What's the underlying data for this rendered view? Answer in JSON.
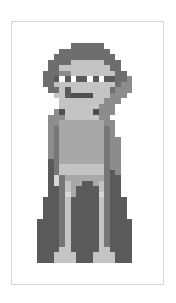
{
  "image": {
    "description": "Grayscale pixel-art figure of a person with dark hair, light visor with four white dot eyes, one arm raised to head, standing in a long dark robe, inside a thin light-gray frame",
    "caption": "Pixel art figure"
  },
  "palette": {
    ".": "transparent",
    "H": "#6e6e6e",
    "D": "#5a5a5a",
    "M": "#8c8c8c",
    "L": "#c4c4c4",
    "l": "#d8d8d8",
    "W": "#ffffff",
    "S": "#a8a8a8",
    "R": "#767676",
    "K": "#4e4e4e"
  },
  "pixel_rows": [
    "......HHHHHH......",
    "....HHHHHHHHH.....",
    "...HHHHHHHHHHH....",
    "..HHHHLLLLLLHHH...",
    "..HHLLLLLLLLLHH...",
    ".HHHMMLLLLLLLLHH..",
    ".HHDWDWDDWDWDDHHM.",
    ".HHLLLLLLLLLLLHMM.",
    "..HHLDLLLLLLLHMMM.",
    "...LLDKKKKLLLMMM..",
    "....LLLLLLLLMMM...",
    "....LLLLLLLMMM....",
    "...MKLLLLLKMMM....",
    "..MMMLLLLLLMM.....",
    "..MMSSSSSSSSMM....",
    "..MRSSSSSSSSRM....",
    "..MRSSSSSSSSRM....",
    "..MRSSSSSSSSRMM...",
    "..MRSSSSSSSSRMM...",
    "..MRSSSSSSSSRMM...",
    "..MRSSSSSSSSRMM...",
    "..DRSSSSSSSSRMM...",
    "..DRLLLLLLLLRMM...",
    "..DRLLLLLLLLRDM...",
    "..DlRSSSSSSSRDD...",
    "..DlRLSSDDSLRDD...",
    "..DDRLSDDDDLRDD...",
    "..DDRlSDDDDlRDD...",
    ".DDDRLDDDDDLRDDD..",
    ".DDDRLDDDDDLRDDD..",
    ".DDDRLDDDDDLRDDD..",
    ".DDDRLDDDDDLRDDD..",
    "DDDDRLDDDDDLRDDDD.",
    "DDDDRLDDDDDLRDDDD.",
    "DDDDRLDDDDDLRDDDD.",
    "DDDDRLDDDDDLRDDDD.",
    "DDDDRLDDDDDLRDDDD.",
    "DDDDLLDDDDDLLDDDD.",
    "DDDLLLLDDDLLLLDDD.",
    "DDDLLLLDDDLLLLDDD."
  ]
}
